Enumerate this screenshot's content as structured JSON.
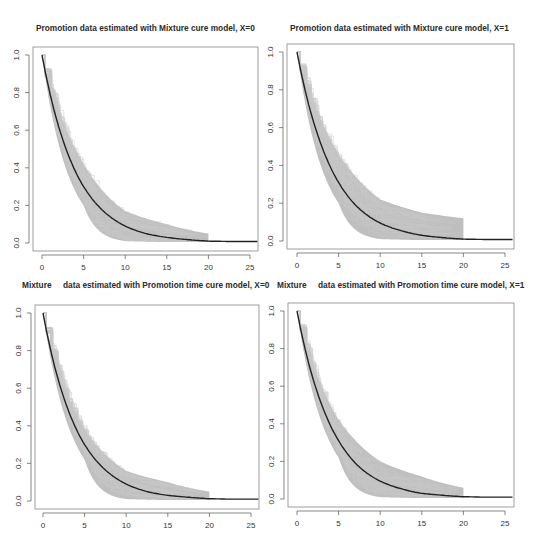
{
  "chart_data": [
    {
      "type": "line",
      "title": "Promotion data estimated with Mixture cure model, X=0",
      "xlabel": "",
      "ylabel": "",
      "xlim": [
        -1,
        26
      ],
      "ylim": [
        0,
        1
      ],
      "xticks": [
        0,
        5,
        10,
        15,
        20,
        25
      ],
      "yticks": [
        "0.0",
        "0.2",
        "0.4",
        "0.6",
        "0.8",
        "1.0"
      ],
      "grid": false,
      "series": [
        {
          "name": "estimated survival (black line)",
          "x": [
            0,
            2.5,
            5,
            7.5,
            10,
            12.5,
            15,
            17.5,
            20,
            22.5,
            26
          ],
          "values": [
            1.0,
            0.55,
            0.3,
            0.165,
            0.09,
            0.05,
            0.03,
            0.018,
            0.01,
            0.008,
            0.008
          ]
        },
        {
          "name": "bootstrap band (grey)",
          "x": [
            0,
            5,
            10,
            15,
            20
          ],
          "upper": [
            1.0,
            0.42,
            0.17,
            0.1,
            0.05
          ],
          "lower": [
            1.0,
            0.2,
            0.01,
            0.005,
            0.005
          ]
        }
      ]
    },
    {
      "type": "line",
      "title": "Promotion data estimated with Mixture cure model, X=1",
      "xlabel": "",
      "ylabel": "",
      "xlim": [
        -1,
        26
      ],
      "ylim": [
        0,
        1
      ],
      "xticks": [
        0,
        5,
        10,
        15,
        20,
        25
      ],
      "yticks": [
        "0.0",
        "0.2",
        "0.4",
        "0.6",
        "0.8",
        "1.0"
      ],
      "grid": false,
      "series": [
        {
          "name": "estimated survival (black line)",
          "x": [
            0,
            2.5,
            5,
            7.5,
            10,
            12.5,
            15,
            17.5,
            20,
            22.5,
            26
          ],
          "values": [
            1.0,
            0.56,
            0.31,
            0.17,
            0.095,
            0.055,
            0.03,
            0.018,
            0.01,
            0.008,
            0.008
          ]
        },
        {
          "name": "bootstrap band (grey)",
          "x": [
            0,
            5,
            10,
            15,
            20
          ],
          "upper": [
            1.0,
            0.46,
            0.22,
            0.15,
            0.12
          ],
          "lower": [
            1.0,
            0.2,
            0.01,
            0.005,
            0.005
          ]
        }
      ]
    },
    {
      "type": "line",
      "title": "Mixture     data estimated with Promotion time cure model, X=0",
      "xlabel": "",
      "ylabel": "",
      "xlim": [
        -1,
        26
      ],
      "ylim": [
        0,
        1
      ],
      "xticks": [
        0,
        5,
        10,
        15,
        20,
        25
      ],
      "yticks": [
        "0.0",
        "0.2",
        "0.4",
        "0.6",
        "0.8",
        "1.0"
      ],
      "grid": false,
      "series": [
        {
          "name": "estimated survival (black line)",
          "x": [
            0,
            2.5,
            5,
            7.5,
            10,
            12.5,
            15,
            17.5,
            20,
            22.5,
            26
          ],
          "values": [
            1.0,
            0.55,
            0.3,
            0.165,
            0.09,
            0.05,
            0.03,
            0.02,
            0.012,
            0.01,
            0.01
          ]
        },
        {
          "name": "bootstrap band (grey)",
          "x": [
            0,
            5,
            10,
            15,
            20
          ],
          "upper": [
            1.0,
            0.38,
            0.16,
            0.1,
            0.05
          ],
          "lower": [
            1.0,
            0.22,
            0.01,
            0.005,
            0.005
          ]
        }
      ]
    },
    {
      "type": "line",
      "title": "Mixture     data estimated with Promotion time cure model, X=1",
      "xlabel": "",
      "ylabel": "",
      "xlim": [
        -1,
        26
      ],
      "ylim": [
        0,
        1
      ],
      "xticks": [
        0,
        5,
        10,
        15,
        20,
        25
      ],
      "yticks": [
        "0.0",
        "0.2",
        "0.4",
        "0.6",
        "0.8",
        "1.0"
      ],
      "grid": false,
      "series": [
        {
          "name": "estimated survival (black line)",
          "x": [
            0,
            2.5,
            5,
            7.5,
            10,
            12.5,
            15,
            17.5,
            20,
            22.5,
            26
          ],
          "values": [
            1.0,
            0.56,
            0.31,
            0.17,
            0.095,
            0.055,
            0.03,
            0.02,
            0.012,
            0.01,
            0.01
          ]
        },
        {
          "name": "bootstrap band (grey)",
          "x": [
            0,
            5,
            10,
            15,
            20
          ],
          "upper": [
            1.0,
            0.42,
            0.2,
            0.12,
            0.06
          ],
          "lower": [
            1.0,
            0.22,
            0.01,
            0.005,
            0.005
          ]
        }
      ]
    }
  ],
  "panels": [
    {
      "title": "Promotion data estimated with Mixture cure model, X=0"
    },
    {
      "title": "Promotion data estimated with Mixture cure model, X=1"
    },
    {
      "title": "Mixture     data estimated with Promotion time cure model, X=0"
    },
    {
      "title": "Mixture     data estimated with Promotion time cure model, X=1"
    }
  ],
  "colors": {
    "band": "#b4b4b4",
    "line": "#222222",
    "axis": "#555555"
  }
}
